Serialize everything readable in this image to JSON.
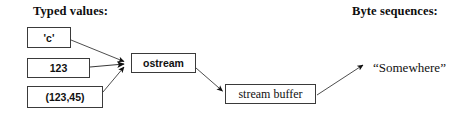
{
  "diagram": {
    "title_left": "Typed values:",
    "title_right": "Byte sequences:",
    "background_color": "#ffffff",
    "line_color": "#3a3a3a",
    "text_color": "#111111",
    "nodes": [
      {
        "id": "char",
        "label": "'c'"
      },
      {
        "id": "int",
        "label": "123"
      },
      {
        "id": "pair",
        "label": "(123,45)"
      },
      {
        "id": "ostream",
        "label": "ostream"
      },
      {
        "id": "streambuf",
        "label": "stream buffer"
      },
      {
        "id": "somewhere",
        "label": "“Somewhere”"
      }
    ],
    "edges": [
      {
        "from": "char",
        "to": "ostream",
        "arrowhead": true
      },
      {
        "from": "int",
        "to": "ostream",
        "arrowhead": true
      },
      {
        "from": "pair",
        "to": "ostream",
        "arrowhead": true
      },
      {
        "from": "ostream",
        "to": "streambuf",
        "arrowhead": true
      },
      {
        "from": "streambuf",
        "to": "somewhere",
        "arrowhead": true
      }
    ]
  }
}
